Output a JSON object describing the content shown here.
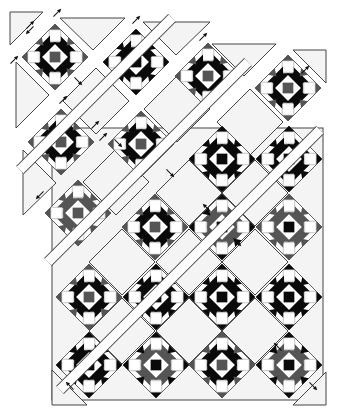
{
  "diagram": {
    "title": "Quilt assembly diagram (diagonal rows, exploded)",
    "colors": {
      "background": "#ffffff",
      "setting_fill": "#f4f4f4",
      "outline": "#444444",
      "dark": "#0a0a0a",
      "medium": "#555555",
      "light": "#ffffff"
    },
    "block_half_diagonal": 33,
    "blocks": [
      {
        "cx": 55,
        "cy": 57,
        "center": "medium",
        "stars": "dark",
        "points": "medium"
      },
      {
        "cx": 136,
        "cy": 62,
        "center": "dark",
        "stars": "dark",
        "points": "dark"
      },
      {
        "cx": 208,
        "cy": 76,
        "center": "medium",
        "stars": "dark",
        "points": "medium"
      },
      {
        "cx": 288,
        "cy": 88,
        "center": "medium",
        "stars": "dark",
        "points": "medium"
      },
      {
        "cx": 61,
        "cy": 142,
        "center": "medium",
        "stars": "dark",
        "points": "medium"
      },
      {
        "cx": 141,
        "cy": 144,
        "center": "medium",
        "stars": "dark",
        "points": "medium"
      },
      {
        "cx": 222,
        "cy": 159,
        "center": "dark",
        "stars": "dark",
        "points": "dark"
      },
      {
        "cx": 289,
        "cy": 159,
        "center": "dark",
        "stars": "dark",
        "points": "dark"
      },
      {
        "cx": 78,
        "cy": 213,
        "center": "medium",
        "stars": "medium",
        "points": "medium"
      },
      {
        "cx": 155,
        "cy": 227,
        "center": "medium",
        "stars": "dark",
        "points": "medium"
      },
      {
        "cx": 222,
        "cy": 227,
        "center": "dark",
        "stars": "medium",
        "points": "dark"
      },
      {
        "cx": 289,
        "cy": 227,
        "center": "dark",
        "stars": "medium",
        "points": "medium"
      },
      {
        "cx": 89,
        "cy": 297,
        "center": "medium",
        "stars": "dark",
        "points": "medium"
      },
      {
        "cx": 156,
        "cy": 297,
        "center": "dark",
        "stars": "dark",
        "points": "dark"
      },
      {
        "cx": 222,
        "cy": 297,
        "center": "dark",
        "stars": "dark",
        "points": "dark"
      },
      {
        "cx": 289,
        "cy": 297,
        "center": "dark",
        "stars": "dark",
        "points": "dark"
      },
      {
        "cx": 89,
        "cy": 365,
        "center": "dark",
        "stars": "dark",
        "points": "dark"
      },
      {
        "cx": 156,
        "cy": 365,
        "center": "dark",
        "stars": "medium",
        "points": "dark"
      },
      {
        "cx": 222,
        "cy": 365,
        "center": "medium",
        "stars": "dark",
        "points": "medium"
      },
      {
        "cx": 289,
        "cy": 365,
        "center": "dark",
        "stars": "medium",
        "points": "dark"
      }
    ],
    "setting_triangles": [
      "10,12 43,12 10,45",
      "60,18 125,18 93,50",
      "143,22 210,22 176,55",
      "212,44 276,44 244,76",
      "293,50 326,50 326,83",
      "16,62 16,128 49,95",
      "23,150 23,215 56,183",
      "45,229 45,293",
      "52,370 52,405 87,405",
      "326,372 326,405 293,405"
    ],
    "setting_squares": [
      {
        "cx": 96,
        "cy": 101
      },
      {
        "cx": 177,
        "cy": 109
      },
      {
        "cx": 250,
        "cy": 122
      },
      {
        "cx": 116,
        "cy": 182
      },
      {
        "cx": 189,
        "cy": 193
      },
      {
        "cx": 255,
        "cy": 193
      },
      {
        "cx": 122,
        "cy": 262
      },
      {
        "cx": 189,
        "cy": 262
      },
      {
        "cx": 255,
        "cy": 262
      },
      {
        "cx": 122,
        "cy": 331
      },
      {
        "cx": 189,
        "cy": 331
      },
      {
        "cx": 255,
        "cy": 331
      }
    ],
    "body_frame": {
      "x": 52,
      "y": 128,
      "w": 271,
      "h": 272
    },
    "diagonal_gaps": [
      {
        "x1": 20,
        "y1": 170,
        "x2": 172,
        "y2": 18
      },
      {
        "x1": 48,
        "y1": 262,
        "x2": 248,
        "y2": 62
      },
      {
        "x1": 60,
        "y1": 390,
        "x2": 320,
        "y2": 130
      }
    ],
    "arrows": [
      {
        "x": 30,
        "y": 25,
        "dir": "ne"
      },
      {
        "x": 57,
        "y": 13,
        "dir": "ne"
      },
      {
        "x": 14,
        "y": 60,
        "dir": "ne"
      },
      {
        "x": 30,
        "y": 30,
        "dir": "sw"
      },
      {
        "x": 78,
        "y": 81,
        "dir": "se"
      },
      {
        "x": 63,
        "y": 100,
        "dir": "ne"
      },
      {
        "x": 136,
        "y": 20,
        "dir": "ne"
      },
      {
        "x": 203,
        "y": 37,
        "dir": "ne"
      },
      {
        "x": 95,
        "y": 125,
        "dir": "ne"
      },
      {
        "x": 118,
        "y": 143,
        "dir": "se"
      },
      {
        "x": 170,
        "y": 173,
        "dir": "se"
      },
      {
        "x": 40,
        "y": 195,
        "dir": "sw"
      },
      {
        "x": 103,
        "y": 137,
        "dir": "ne"
      },
      {
        "x": 305,
        "y": 70,
        "dir": "ne"
      },
      {
        "x": 207,
        "y": 208,
        "dir": "nw"
      },
      {
        "x": 237,
        "y": 242,
        "dir": "se"
      },
      {
        "x": 278,
        "y": 347,
        "dir": "nw"
      },
      {
        "x": 313,
        "y": 386,
        "dir": "se"
      },
      {
        "x": 70,
        "y": 386,
        "dir": "nw"
      }
    ]
  }
}
